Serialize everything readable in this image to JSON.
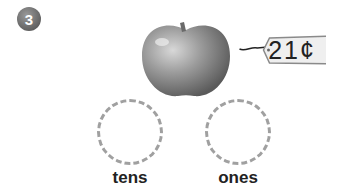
{
  "problem": {
    "number": "3",
    "item": "apple",
    "price_tag": "21¢",
    "place_values": [
      {
        "label": "tens"
      },
      {
        "label": "ones"
      }
    ]
  }
}
